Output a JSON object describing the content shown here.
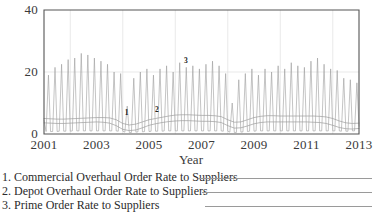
{
  "chart_data": {
    "type": "line",
    "title": "",
    "xlabel": "Year",
    "ylabel": "",
    "xlim": [
      2001,
      2013
    ],
    "ylim": [
      0,
      40
    ],
    "grid": true,
    "legend_position": "below",
    "x_ticks": [
      "2001",
      "2003",
      "2005",
      "2007",
      "2009",
      "2011",
      "2013"
    ],
    "x_tick_values": [
      2001,
      2003,
      2005,
      2007,
      2009,
      2011,
      2013
    ],
    "y_ticks": [
      "0",
      "20",
      "40"
    ],
    "y_tick_values": [
      0,
      20,
      40
    ],
    "inline_labels": [
      {
        "text": "1",
        "x": 2004.15,
        "y": 6.2
      },
      {
        "text": "2",
        "x": 2005.3,
        "y": 7.0
      },
      {
        "text": "3",
        "x": 2006.4,
        "y": 23.0
      }
    ],
    "series": [
      {
        "name": "Commercial Overhaul Order Rate to Suppliers",
        "number": "1",
        "color": "#8d8d8d",
        "x": [
          2001.0,
          2001.25,
          2001.5,
          2001.75,
          2002.0,
          2002.25,
          2002.5,
          2002.75,
          2003.0,
          2003.25,
          2003.5,
          2003.75,
          2004.0,
          2004.25,
          2004.5,
          2004.75,
          2005.0,
          2005.25,
          2005.5,
          2005.75,
          2006.0,
          2006.25,
          2006.5,
          2006.75,
          2007.0,
          2007.25,
          2007.5,
          2007.75,
          2008.0,
          2008.25,
          2008.5,
          2008.75,
          2009.0,
          2009.25,
          2009.5,
          2009.75,
          2010.0,
          2010.25,
          2010.5,
          2010.75,
          2011.0,
          2011.25,
          2011.5,
          2011.75,
          2012.0,
          2012.25,
          2012.5,
          2012.75,
          2013.0
        ],
        "y": [
          5.0,
          4.9,
          4.8,
          4.8,
          4.9,
          5.0,
          5.1,
          5.2,
          5.3,
          5.3,
          5.2,
          4.6,
          3.4,
          2.9,
          3.2,
          3.9,
          4.6,
          5.0,
          5.4,
          5.8,
          6.1,
          6.2,
          6.2,
          6.1,
          6.0,
          6.0,
          5.9,
          5.6,
          4.6,
          3.8,
          3.9,
          4.6,
          5.3,
          5.7,
          5.9,
          5.9,
          5.8,
          5.8,
          5.8,
          5.8,
          5.8,
          5.8,
          5.7,
          5.5,
          5.0,
          4.2,
          3.6,
          3.4,
          3.5
        ]
      },
      {
        "name": "Depot Overhaul Order Rate to Suppliers",
        "number": "2",
        "color": "#8d8d8d",
        "x": [
          2001.0,
          2001.25,
          2001.5,
          2001.75,
          2002.0,
          2002.25,
          2002.5,
          2002.75,
          2003.0,
          2003.25,
          2003.5,
          2003.75,
          2004.0,
          2004.25,
          2004.5,
          2004.75,
          2005.0,
          2005.25,
          2005.5,
          2005.75,
          2006.0,
          2006.25,
          2006.5,
          2006.75,
          2007.0,
          2007.25,
          2007.5,
          2007.75,
          2008.0,
          2008.25,
          2008.5,
          2008.75,
          2009.0,
          2009.25,
          2009.5,
          2009.75,
          2010.0,
          2010.25,
          2010.5,
          2010.75,
          2011.0,
          2011.25,
          2011.5,
          2011.75,
          2012.0,
          2012.25,
          2012.5,
          2012.75,
          2013.0
        ],
        "y": [
          3.6,
          3.5,
          3.4,
          3.4,
          3.5,
          3.6,
          3.7,
          3.8,
          3.9,
          3.8,
          3.5,
          2.7,
          1.5,
          1.1,
          1.3,
          2.0,
          2.8,
          3.3,
          3.7,
          4.0,
          4.2,
          4.3,
          4.3,
          4.2,
          4.1,
          4.1,
          4.0,
          3.7,
          2.7,
          1.9,
          2.0,
          2.6,
          3.3,
          3.7,
          3.9,
          3.9,
          3.9,
          3.9,
          3.9,
          3.9,
          3.9,
          3.8,
          3.7,
          3.4,
          2.8,
          2.1,
          1.7,
          1.6,
          1.8
        ]
      },
      {
        "name": "Prime Order Rate to Suppliers",
        "number": "3",
        "color": "#9c9c9c",
        "description": "Strongly seasonal spikes, roughly one sharp peak per year-quarter cycle",
        "x": [
          2001.0,
          2001.08,
          2001.17,
          2001.25,
          2001.33,
          2001.42,
          2001.5,
          2001.58,
          2001.67,
          2001.75,
          2001.83,
          2001.92,
          2002.0,
          2002.08,
          2002.17,
          2002.25,
          2002.33,
          2002.42,
          2002.5,
          2002.58,
          2002.67,
          2002.75,
          2002.83,
          2002.92,
          2003.0,
          2003.08,
          2003.17,
          2003.25,
          2003.33,
          2003.42,
          2003.5,
          2003.58,
          2003.67,
          2003.75,
          2003.83,
          2003.92,
          2004.0,
          2004.08,
          2004.17,
          2004.25,
          2004.33,
          2004.42,
          2004.5,
          2004.58,
          2004.67,
          2004.75,
          2004.83,
          2004.92,
          2005.0,
          2005.08,
          2005.17,
          2005.25,
          2005.33,
          2005.42,
          2005.5,
          2005.58,
          2005.67,
          2005.75,
          2005.83,
          2005.92,
          2006.0,
          2006.08,
          2006.17,
          2006.25,
          2006.33,
          2006.42,
          2006.5,
          2006.58,
          2006.67,
          2006.75,
          2006.83,
          2006.92,
          2007.0,
          2007.08,
          2007.17,
          2007.25,
          2007.33,
          2007.42,
          2007.5,
          2007.58,
          2007.67,
          2007.75,
          2007.83,
          2007.92,
          2008.0,
          2008.08,
          2008.17,
          2008.25,
          2008.33,
          2008.42,
          2008.5,
          2008.58,
          2008.67,
          2008.75,
          2008.83,
          2008.92,
          2009.0,
          2009.08,
          2009.17,
          2009.25,
          2009.33,
          2009.42,
          2009.5,
          2009.58,
          2009.67,
          2009.75,
          2009.83,
          2009.92,
          2010.0,
          2010.08,
          2010.17,
          2010.25,
          2010.33,
          2010.42,
          2010.5,
          2010.58,
          2010.67,
          2010.75,
          2010.83,
          2010.92,
          2011.0,
          2011.08,
          2011.17,
          2011.25,
          2011.33,
          2011.42,
          2011.5,
          2011.58,
          2011.67,
          2011.75,
          2011.83,
          2011.92,
          2012.0,
          2012.08,
          2012.17,
          2012.25,
          2012.33,
          2012.42,
          2012.5,
          2012.58,
          2012.67,
          2012.75,
          2012.83,
          2012.92,
          2013.0
        ],
        "y": [
          4.5,
          0.8,
          19.0,
          0.8,
          0.8,
          21.5,
          0.8,
          0.9,
          22.5,
          0.9,
          0.9,
          24.0,
          0.9,
          1.0,
          24.5,
          1.0,
          1.0,
          26.0,
          1.0,
          1.0,
          25.5,
          1.0,
          1.0,
          24.5,
          1.0,
          1.0,
          23.5,
          1.0,
          1.0,
          22.5,
          1.0,
          1.0,
          20.0,
          1.0,
          0.9,
          19.5,
          0.9,
          0.6,
          9.0,
          0.5,
          0.5,
          18.0,
          0.6,
          0.7,
          20.0,
          0.7,
          0.8,
          21.0,
          0.8,
          0.9,
          19.0,
          0.9,
          0.9,
          21.0,
          0.9,
          1.0,
          22.0,
          1.0,
          1.0,
          20.0,
          1.0,
          1.0,
          23.0,
          1.0,
          1.0,
          21.5,
          1.0,
          1.0,
          22.0,
          1.0,
          1.0,
          21.0,
          1.0,
          1.0,
          22.5,
          1.0,
          1.0,
          23.5,
          1.0,
          1.0,
          22.0,
          1.0,
          0.9,
          19.5,
          0.9,
          0.6,
          10.0,
          0.5,
          0.5,
          17.5,
          0.6,
          0.7,
          19.5,
          0.8,
          0.9,
          21.0,
          0.9,
          1.0,
          19.0,
          1.0,
          1.0,
          21.0,
          1.0,
          1.0,
          20.0,
          1.0,
          1.0,
          22.0,
          1.0,
          1.0,
          21.0,
          1.0,
          1.0,
          23.0,
          1.0,
          1.0,
          22.0,
          1.0,
          1.0,
          21.5,
          1.0,
          1.0,
          23.5,
          1.0,
          1.0,
          24.5,
          1.0,
          1.0,
          22.5,
          1.0,
          1.0,
          21.0,
          1.0,
          1.0,
          20.5,
          1.0,
          0.9,
          18.0,
          0.9,
          0.9,
          17.5,
          1.0,
          1.0,
          16.5,
          2.5
        ]
      }
    ]
  },
  "legend": {
    "entries": [
      {
        "label": "1. Commercial Overhaul Order Rate to Suppliers"
      },
      {
        "label": "2. Depot Overhaul Order Rate to Suppliers"
      },
      {
        "label": "3. Prime Order Rate to Suppliers"
      }
    ]
  },
  "axis": {
    "x_title": "Year"
  }
}
